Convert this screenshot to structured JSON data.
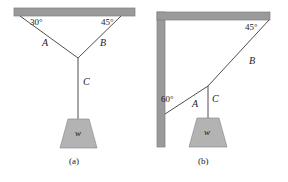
{
  "figure": {
    "width": 288,
    "height": 182,
    "background": "#ffffff",
    "colors": {
      "support": "#9a9a9a",
      "support_edge": "#7e7e7e",
      "cable": "#3a3a3a",
      "block_fill": "#b3b3b3",
      "block_edge": "#8c8c8c",
      "text": "#1a1a1a"
    }
  },
  "panels": [
    {
      "id": "a",
      "caption": "(a)",
      "support_type": "ceiling-bar",
      "angles": [
        {
          "name": "angle-left",
          "value": "30°",
          "x": 30,
          "y": 22
        },
        {
          "name": "angle-right",
          "value": "45°",
          "x": 101,
          "y": 22
        }
      ],
      "cables": [
        {
          "name": "cable-a",
          "label": "A",
          "x": 44,
          "y": 44,
          "from": "ceiling-left",
          "to": "junction"
        },
        {
          "name": "cable-b",
          "label": "B",
          "x": 101,
          "y": 44,
          "from": "ceiling-right",
          "to": "junction"
        },
        {
          "name": "cable-c",
          "label": "C",
          "x": 89,
          "y": 84,
          "from": "junction",
          "to": "weight"
        }
      ],
      "weight": {
        "label": "w",
        "x": 81,
        "y": 136
      },
      "caption_pos": {
        "x": 78,
        "y": 163
      }
    },
    {
      "id": "b",
      "caption": "(b)",
      "support_type": "wall-and-ceiling-corner",
      "angles": [
        {
          "name": "angle-wall",
          "value": "60°",
          "x": 165,
          "y": 100
        },
        {
          "name": "angle-ceiling",
          "value": "45°",
          "x": 249,
          "y": 27
        }
      ],
      "cables": [
        {
          "name": "cable-a",
          "label": "A",
          "x": 196,
          "y": 105,
          "from": "wall",
          "to": "junction"
        },
        {
          "name": "cable-b",
          "label": "B",
          "x": 252,
          "y": 62,
          "from": "ceiling-corner",
          "to": "junction"
        },
        {
          "name": "cable-c",
          "label": "C",
          "x": 214,
          "y": 100,
          "from": "junction",
          "to": "weight"
        }
      ],
      "weight": {
        "label": "w",
        "x": 207,
        "y": 135
      },
      "caption_pos": {
        "x": 206,
        "y": 163
      }
    }
  ]
}
